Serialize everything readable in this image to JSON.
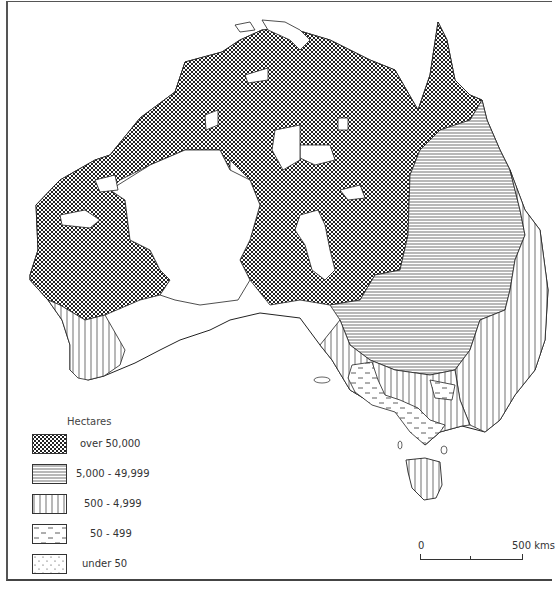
{
  "map": {
    "subject": "Australia farm size distribution",
    "region": "Australia",
    "legend": {
      "title": "Hectares",
      "items": [
        {
          "label": "over   50,000",
          "pattern": "crosshatch"
        },
        {
          "label": "5,000 - 49,999",
          "pattern": "horizontal-lines"
        },
        {
          "label": "500 -   4,999",
          "pattern": "vertical-lines"
        },
        {
          "label": "50 -      499",
          "pattern": "dashes"
        },
        {
          "label": "under  50",
          "pattern": "dots"
        }
      ]
    },
    "scale_bar": {
      "start_label": "0",
      "end_label": "500 kms"
    },
    "colors": {
      "ink": "#222222",
      "paper": "#ffffff"
    }
  }
}
